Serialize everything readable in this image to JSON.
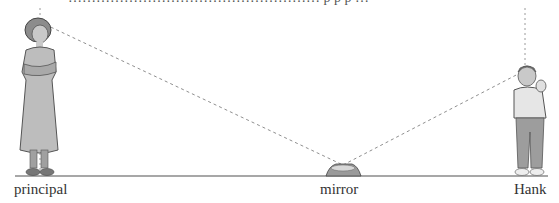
{
  "figure": {
    "top_text_fragment": "……………………………………………… p p p  …",
    "labels": {
      "principal": "principal",
      "mirror": "mirror",
      "hank": "Hank"
    },
    "colors": {
      "ground_line": "#8a8a8a",
      "dashed_line": "#8f8f8f",
      "figure_fill": "#b8b8b8",
      "figure_outline": "#555555",
      "label_text": "#333333"
    },
    "geometry": {
      "ground_y": 176,
      "ground_x_start": 15,
      "ground_x_end": 548,
      "principal_eye": [
        40,
        22
      ],
      "mirror_point": [
        343,
        165
      ],
      "hank_eye": [
        522,
        72
      ],
      "principal_vertical_x": 40,
      "hank_vertical_x": 525
    }
  }
}
